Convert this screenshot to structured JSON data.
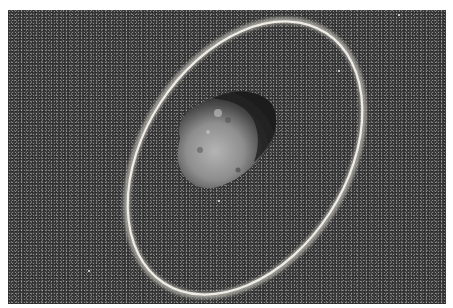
{
  "image": {
    "description": "Artist rendering of an irregular grey asteroid encircled by a thin bright tilted ring against a dark, grainy starfield",
    "subject": "asteroid with ring",
    "colors": {
      "background_space": "#3c3c3c",
      "ring": "#e8e6e0",
      "asteroid_light": "#a6a6a6",
      "asteroid_shadow": "#1e1e1e",
      "margin": "#ffffff"
    }
  }
}
